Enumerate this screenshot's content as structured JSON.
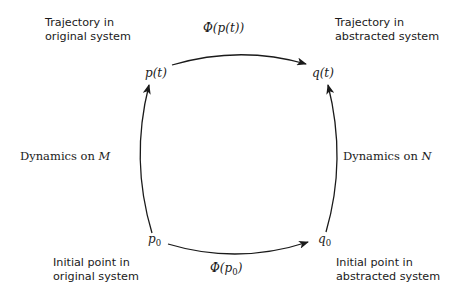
{
  "corners": {
    "top_left": {
      "line1": "Trajectory in",
      "line2": "original system"
    },
    "top_right": {
      "line1": "Trajectory in",
      "line2": "abstracted system"
    },
    "bottom_left": {
      "line1": "Initial point in",
      "line2": "original system"
    },
    "bottom_right": {
      "line1": "Initial point in",
      "line2": "abstracted system"
    }
  },
  "nodes": {
    "p_t": "p(t)",
    "q_t": "q(t)",
    "p0": {
      "base": "p",
      "sub": "0"
    },
    "q0": {
      "base": "q",
      "sub": "0"
    }
  },
  "edges": {
    "top": {
      "prefix": "Φ(",
      "arg": "p(t)",
      "suffix": ")",
      "from": "p(t)",
      "to": "q(t)"
    },
    "bottom": {
      "prefix": "Φ(",
      "arg_base": "p",
      "arg_sub": "0",
      "suffix": ")",
      "from": "p0",
      "to": "q0"
    },
    "left": {
      "text": "Dynamics on ",
      "symbol": "M",
      "from": "p0",
      "to": "p(t)"
    },
    "right": {
      "text": "Dynamics on ",
      "symbol": "N",
      "from": "q0",
      "to": "q(t)"
    }
  },
  "colors": {
    "ink": "#1a1a1a",
    "background": "#ffffff"
  }
}
